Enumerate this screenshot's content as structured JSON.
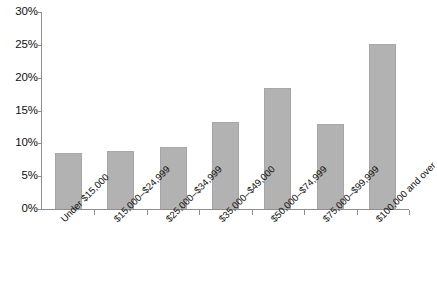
{
  "chart_data": {
    "type": "bar",
    "title": "",
    "subtitle": "",
    "xlabel": "",
    "ylabel": "",
    "categories": [
      "Under $15,000",
      "$15,000–$24,999",
      "$25,000–$34,999",
      "$35,000–$49,000",
      "$50,000–$74,999",
      "$75,000–$99,999",
      "$100,000 and over"
    ],
    "values": [
      8.6,
      8.8,
      9.4,
      13.3,
      18.4,
      13.0,
      25.2
    ],
    "value_suffix": "%",
    "ylim": [
      0,
      30
    ],
    "ytick_values": [
      0,
      5,
      10,
      15,
      20,
      25,
      30
    ],
    "ytick_labels": [
      "0%",
      "5%",
      "10%",
      "15%",
      "20%",
      "25%",
      "30%"
    ],
    "grid": false,
    "legend": null,
    "bar_color": "#b2b2b2",
    "bar_edge_color": "#a5a5a5",
    "axis_color": "#8e8e8e",
    "text_color": "#111111",
    "background_color": "#ffffff",
    "xtick_label_rotation": -45
  }
}
